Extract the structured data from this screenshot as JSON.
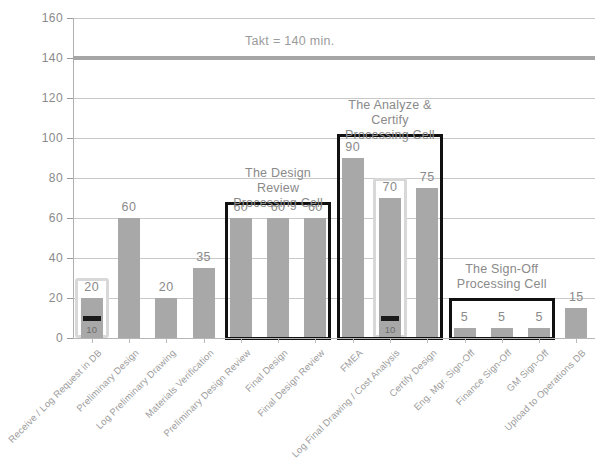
{
  "chart_data": {
    "type": "bar",
    "title": "",
    "xlabel": "",
    "ylabel": "",
    "ylim": [
      0,
      160
    ],
    "ytick_step": 20,
    "yticks": [
      "0",
      "20",
      "40",
      "60",
      "80",
      "100",
      "120",
      "140",
      "160"
    ],
    "grid": true,
    "legend": "none",
    "categories": [
      "Receive / Log Request in DB",
      "Preliminary Design",
      "Log Preliminary Drawing",
      "Materials Verification",
      "Preliminary Design Review",
      "Final Design",
      "Final Design Review",
      "FMEA",
      "Log Final Drawing / Cost Analysis",
      "Certify Design",
      "Eng. Mgr. Sign-Off",
      "Finance Sign-Off",
      "GM Sign-Off",
      "Upload to Operations DB"
    ],
    "values": [
      20,
      60,
      20,
      35,
      60,
      60,
      60,
      90,
      70,
      75,
      5,
      5,
      5,
      15
    ],
    "value_labels": [
      "20",
      "60",
      "20",
      "35",
      "60",
      "60",
      "60",
      "90",
      "70",
      "75",
      "5",
      "5",
      "5",
      "15"
    ],
    "reference_line": {
      "value": 140,
      "label": "Takt = 140 min.",
      "color": "#a6a6a6"
    },
    "annotations": [
      {
        "type": "inner-segment",
        "category_index": 0,
        "value": 10,
        "label": "10",
        "color": "#1a1a1a"
      },
      {
        "type": "inner-segment",
        "category_index": 8,
        "value": 10,
        "label": "10",
        "color": "#1a1a1a"
      }
    ],
    "highlight_boxes": [
      {
        "name": "receive-log-highlight",
        "category_index": 0,
        "style": "light"
      },
      {
        "name": "log-final-drawing-highlight",
        "category_index": 8,
        "style": "light"
      }
    ],
    "groups": [
      {
        "name": "design-review-cell",
        "title": "The Design Review\nProcessing Cell",
        "from_index": 4,
        "to_index": 6
      },
      {
        "name": "analyze-certify-cell",
        "title": "The Analyze & Certify\nProcessing Cell",
        "from_index": 7,
        "to_index": 9
      },
      {
        "name": "sign-off-cell",
        "title": "The Sign-Off\nProcessing Cell",
        "from_index": 10,
        "to_index": 12
      }
    ],
    "colors": {
      "bar": "#a8a8a8",
      "grid": "#c9c9c9",
      "text": "#8a8a8a",
      "group_box": "#111111",
      "dark_segment": "#1a1a1a"
    }
  }
}
